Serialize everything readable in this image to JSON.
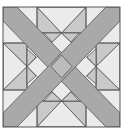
{
  "diagram": {
    "caption": "Crossed-bands quilt block with hourglass units",
    "colors": {
      "background": "#ffffff",
      "light": "#ebebeb",
      "medium": "#c9c9c9",
      "band": "#a9a9a9",
      "center": "#bcbcbc",
      "line": "#555555"
    },
    "elements": [
      {
        "name": "outer-square",
        "shape": "square"
      },
      {
        "name": "diagonal-band-1",
        "shape": "band",
        "direction": "top-left to bottom-right"
      },
      {
        "name": "diagonal-band-2",
        "shape": "band",
        "direction": "top-right to bottom-left"
      },
      {
        "name": "hourglass-top",
        "shape": "rectangle with X"
      },
      {
        "name": "hourglass-bottom",
        "shape": "rectangle with X"
      },
      {
        "name": "hourglass-left",
        "shape": "rectangle with X"
      },
      {
        "name": "hourglass-right",
        "shape": "rectangle with X"
      },
      {
        "name": "center-diamond",
        "shape": "diamond"
      }
    ]
  }
}
